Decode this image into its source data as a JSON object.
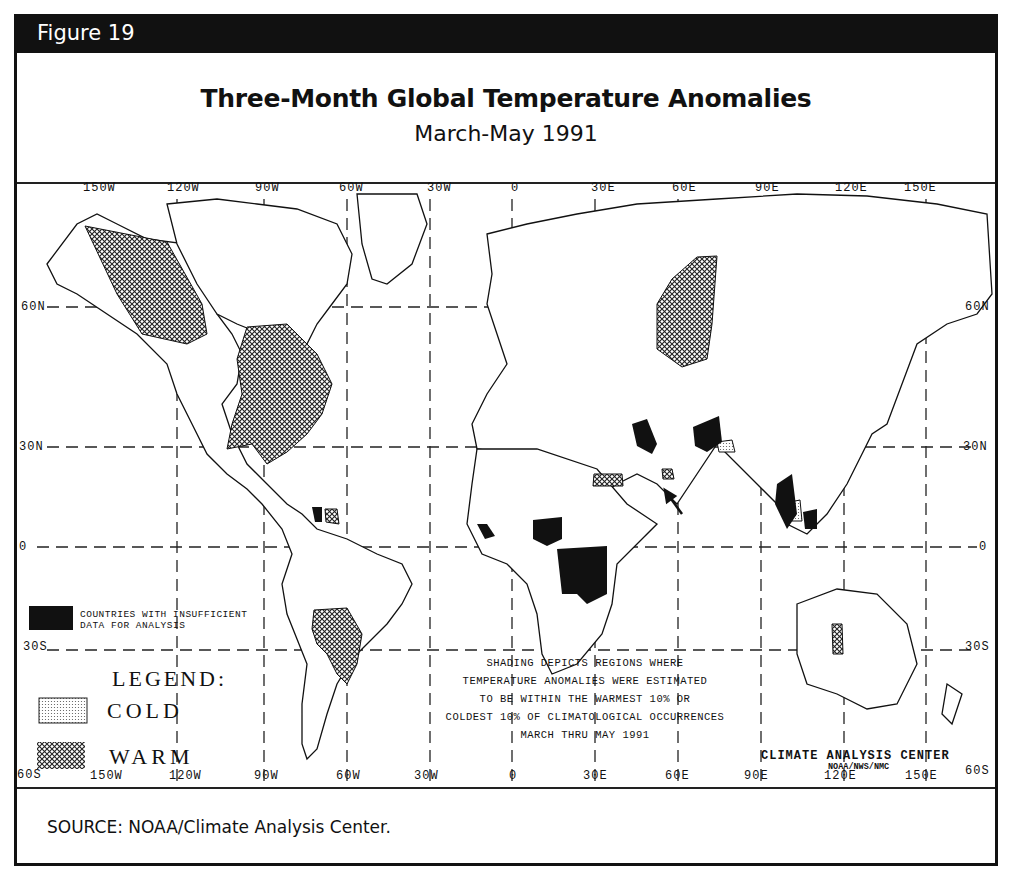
{
  "figure": {
    "label": "Figure 19",
    "title": "Three-Month Global Temperature Anomalies",
    "subtitle": "March-May 1991",
    "source": "SOURCE:  NOAA/Climate Analysis Center."
  },
  "map": {
    "top_longitude_labels": [
      "150W",
      "120W",
      "90W",
      "60W",
      "30W",
      "0",
      "30E",
      "60E",
      "90E",
      "120E",
      "150E"
    ],
    "bottom_longitude_labels": [
      "150W",
      "120W",
      "90W",
      "60W",
      "30W",
      "0",
      "30E",
      "60E",
      "90E",
      "120E",
      "150E"
    ],
    "left_latitude_labels": [
      "60N",
      "30N",
      "0",
      "30S",
      "60S"
    ],
    "right_latitude_labels": [
      "60N",
      "30N",
      "0",
      "30S",
      "60S"
    ],
    "insufficient_data_label_line1": "COUNTRIES WITH INSUFFICIENT",
    "insufficient_data_label_line2": "DATA FOR ANALYSIS",
    "legend": {
      "title": "LEGEND:",
      "cold_label": "COLD",
      "warm_label": "WARM"
    },
    "note_lines": [
      "SHADING DEPICTS REGIONS WHERE",
      "TEMPERATURE ANOMALIES WERE ESTIMATED",
      "TO BE WITHIN THE WARMEST 10% OR",
      "COLDEST 10% OF CLIMATOLOGICAL OCCURRENCES",
      "MARCH THRU MAY 1991"
    ],
    "credit": "CLIMATE ANALYSIS CENTER",
    "credit_sub": "NOAA/NWS/NMC",
    "regions": {
      "warm": [
        "Alaska / NW Canada",
        "Eastern United States / SE Canada",
        "Western Siberia",
        "Northern Argentina / Paraguay",
        "Sudan/Egypt strip",
        "Western Australia",
        "Persian Gulf",
        "Central America",
        "Venezuela"
      ],
      "cold": [
        "Northern India / Nepal",
        "Thailand interior"
      ],
      "insufficient": [
        "Iraq",
        "Afghanistan",
        "Nigeria",
        "Zaire",
        "Liberia",
        "Myanmar",
        "Cambodia",
        "Nicaragua"
      ]
    }
  }
}
